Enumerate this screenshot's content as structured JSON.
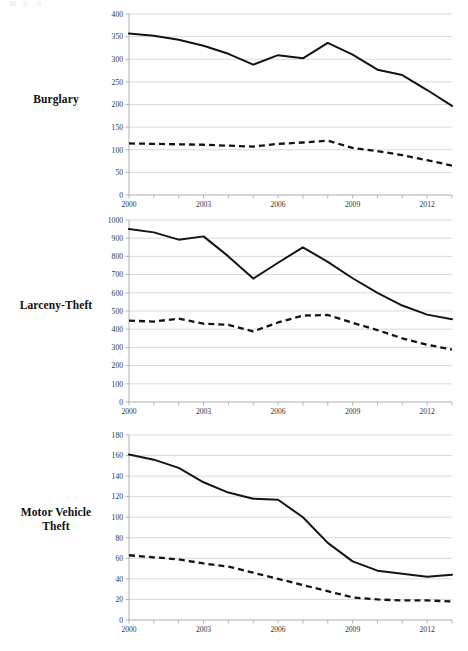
{
  "figure": {
    "background": "#ffffff",
    "line_color": "#141414",
    "grid_color": "#c8c8c8",
    "axis_color": "#9a9a9a",
    "width": 468,
    "height": 651
  },
  "panels": [
    {
      "label": "Burglary",
      "label_lines": [
        "Burglary"
      ],
      "label_top": 93,
      "panel_top": 0,
      "panel_height": 210,
      "plot": {
        "left": 129,
        "right": 452,
        "top": 14,
        "bottom": 195
      },
      "ylim": [
        0,
        400
      ],
      "yticks": [
        0,
        50,
        100,
        150,
        200,
        250,
        300,
        350,
        400
      ],
      "ytick_labels": [
        "0",
        "50",
        "100",
        "150",
        "200",
        "250",
        "300",
        "350",
        "400"
      ],
      "xlim": [
        2000,
        2013
      ],
      "xticks": [
        2000,
        2003,
        2006,
        2009,
        2012
      ],
      "xtick_labels": [
        "2000",
        "2003",
        "2006",
        "2009",
        "2012"
      ]
    },
    {
      "label": "Larceny-Theft",
      "label_lines": [
        "Larceny-Theft"
      ],
      "label_top": 299,
      "panel_top": 210,
      "panel_height": 215,
      "plot": {
        "left": 129,
        "right": 452,
        "top": 220,
        "bottom": 402
      },
      "ylim": [
        0,
        1000
      ],
      "yticks": [
        0,
        100,
        200,
        300,
        400,
        500,
        600,
        700,
        800,
        900,
        1000
      ],
      "ytick_labels": [
        "0",
        "100",
        "200",
        "300",
        "400",
        "500",
        "600",
        "700",
        "800",
        "900",
        "1000"
      ],
      "xlim": [
        2000,
        2013
      ],
      "xticks": [
        2000,
        2003,
        2006,
        2009,
        2012
      ],
      "xtick_labels": [
        "2000",
        "2003",
        "2006",
        "2009",
        "2012"
      ]
    },
    {
      "label": "Motor Vehicle Theft",
      "label_lines": [
        "Motor Vehicle",
        "Theft"
      ],
      "label_top": 506,
      "panel_top": 425,
      "panel_height": 226,
      "plot": {
        "left": 129,
        "right": 452,
        "top": 435,
        "bottom": 620
      },
      "ylim": [
        0,
        180
      ],
      "yticks": [
        0,
        20,
        40,
        60,
        80,
        100,
        120,
        140,
        160,
        180
      ],
      "ytick_labels": [
        "0",
        "20",
        "40",
        "60",
        "80",
        "100",
        "120",
        "140",
        "160",
        "180"
      ],
      "xlim": [
        2000,
        2013
      ],
      "xticks": [
        2000,
        2003,
        2006,
        2009,
        2012
      ],
      "xtick_labels": [
        "2000",
        "2003",
        "2006",
        "2009",
        "2012"
      ]
    }
  ],
  "chart_data": [
    {
      "type": "line",
      "title": "Burglary",
      "xlabel": "",
      "ylabel": "",
      "x": [
        2000,
        2001,
        2002,
        2003,
        2004,
        2005,
        2006,
        2007,
        2008,
        2009,
        2010,
        2011,
        2012,
        2013
      ],
      "xlim": [
        2000,
        2013
      ],
      "ylim": [
        0,
        400
      ],
      "grid": true,
      "legend": "none",
      "series": [
        {
          "name": "solid-series",
          "style": "solid",
          "values": [
            357,
            352,
            343,
            330,
            312,
            288,
            309,
            302,
            336,
            310,
            277,
            265,
            232,
            197
          ]
        },
        {
          "name": "dashed-series",
          "style": "dashed",
          "values": [
            114,
            113,
            112,
            111,
            109,
            107,
            113,
            116,
            120,
            104,
            97,
            88,
            77,
            65
          ]
        }
      ]
    },
    {
      "type": "line",
      "title": "Larceny-Theft",
      "xlabel": "",
      "ylabel": "",
      "x": [
        2000,
        2001,
        2002,
        2003,
        2004,
        2005,
        2006,
        2007,
        2008,
        2009,
        2010,
        2011,
        2012,
        2013
      ],
      "xlim": [
        2000,
        2013
      ],
      "ylim": [
        0,
        1000
      ],
      "grid": true,
      "legend": "none",
      "series": [
        {
          "name": "solid-series",
          "style": "solid",
          "values": [
            950,
            932,
            892,
            910,
            800,
            678,
            765,
            850,
            770,
            680,
            600,
            530,
            480,
            455
          ]
        },
        {
          "name": "dashed-series",
          "style": "dashed",
          "values": [
            447,
            442,
            458,
            430,
            424,
            388,
            437,
            475,
            478,
            435,
            395,
            350,
            315,
            288
          ]
        }
      ]
    },
    {
      "type": "line",
      "title": "Motor Vehicle Theft",
      "xlabel": "",
      "ylabel": "",
      "x": [
        2000,
        2001,
        2002,
        2003,
        2004,
        2005,
        2006,
        2007,
        2008,
        2009,
        2010,
        2011,
        2012,
        2013
      ],
      "xlim": [
        2000,
        2013
      ],
      "ylim": [
        0,
        180
      ],
      "grid": true,
      "legend": "none",
      "series": [
        {
          "name": "solid-series",
          "style": "solid",
          "values": [
            161,
            156,
            148,
            134,
            124,
            118,
            117,
            100,
            75,
            57,
            48,
            45,
            42,
            44
          ]
        },
        {
          "name": "dashed-series",
          "style": "dashed",
          "values": [
            63,
            61,
            59,
            55,
            52,
            46,
            40,
            34,
            28,
            22,
            20,
            19,
            19,
            18
          ]
        }
      ]
    }
  ]
}
